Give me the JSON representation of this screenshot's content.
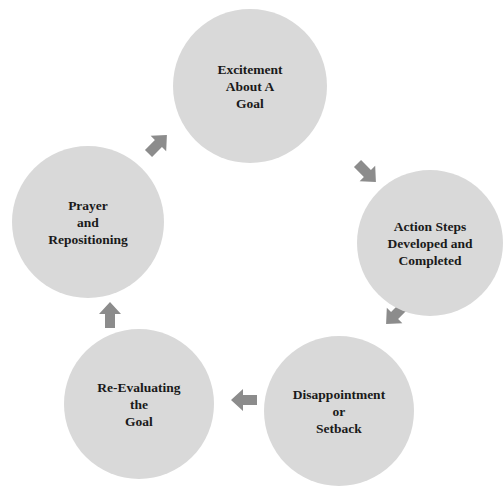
{
  "diagram": {
    "type": "cycle",
    "colors": {
      "node_fill": "#d9d9d9",
      "arrow": "#8c8c8c",
      "text": "#1a1a1a"
    },
    "nodes": [
      {
        "id": "excitement",
        "lines": [
          "Excitement",
          "About A",
          "Goal"
        ]
      },
      {
        "id": "action",
        "lines": [
          "Action Steps",
          "Developed and",
          "Completed"
        ]
      },
      {
        "id": "disappointment",
        "lines": [
          "Disappointment",
          "or",
          "Setback"
        ]
      },
      {
        "id": "reevaluating",
        "lines": [
          "Re-Evaluating",
          "the",
          "Goal"
        ]
      },
      {
        "id": "prayer",
        "lines": [
          "Prayer",
          "and",
          "Repositioning"
        ]
      }
    ],
    "edges": [
      {
        "from": "excitement",
        "to": "action"
      },
      {
        "from": "action",
        "to": "disappointment"
      },
      {
        "from": "disappointment",
        "to": "reevaluating"
      },
      {
        "from": "reevaluating",
        "to": "prayer"
      },
      {
        "from": "prayer",
        "to": "excitement"
      }
    ]
  }
}
